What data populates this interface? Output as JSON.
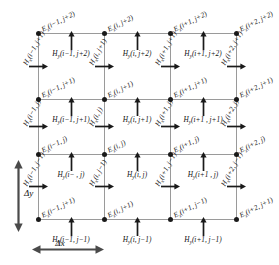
{
  "figure": {
    "type": "fdtd-yee-grid-diagram",
    "node_color": "#1a1a1a",
    "grid_line_color": "#9a9a9a",
    "text_color": "#111111"
  },
  "axes": {
    "dy_label": "Δy",
    "dx_label": "Δx",
    "dy_name": "delta-y-dimension",
    "dx_name": "delta-x-dimension"
  },
  "symbols": {
    "E": "E",
    "E_sub": "z",
    "Hx": "H",
    "Hx_sub": "x",
    "Hy": "H",
    "Hy_sub": "y"
  },
  "grid": {
    "columns": 4,
    "rows": 4,
    "col_x": [
      38,
      104,
      170,
      236
    ],
    "row_y": [
      33,
      99,
      154,
      219
    ]
  },
  "ez_nodes": [
    {
      "col": 0,
      "row": 0,
      "arg": "(i−1, j+2)"
    },
    {
      "col": 1,
      "row": 0,
      "arg": "(i, j+2)"
    },
    {
      "col": 2,
      "row": 0,
      "arg": "(i+1, j+2)"
    },
    {
      "col": 3,
      "row": 0,
      "arg": "(i+2, j+2)"
    },
    {
      "col": 0,
      "row": 1,
      "arg": "(i−1, j+1)"
    },
    {
      "col": 1,
      "row": 1,
      "arg": "(i, j+1)"
    },
    {
      "col": 2,
      "row": 1,
      "arg": "(i+1, j+1)"
    },
    {
      "col": 3,
      "row": 1,
      "arg": "(i+2, j+1)"
    },
    {
      "col": 0,
      "row": 2,
      "arg": "(i−1, j)"
    },
    {
      "col": 1,
      "row": 2,
      "arg": "(i, j)"
    },
    {
      "col": 2,
      "row": 2,
      "arg": "(i+1, j)"
    },
    {
      "col": 3,
      "row": 2,
      "arg": "(i+2, j)"
    },
    {
      "col": 0,
      "row": 3,
      "arg": "(i−1, j+1)"
    },
    {
      "col": 1,
      "row": 3,
      "arg": "(i, j+1)"
    },
    {
      "col": 2,
      "row": 3,
      "arg": "(i+1, j−1)"
    },
    {
      "col": 3,
      "row": 3,
      "arg": "(i+2, j+1)"
    }
  ],
  "hy_arrows": [
    {
      "cell_col": 0,
      "row": 0,
      "arg": "(i−1, j+2)"
    },
    {
      "cell_col": 1,
      "row": 0,
      "arg": "(i, j+2)"
    },
    {
      "cell_col": 2,
      "row": 0,
      "arg": "(i+1, j+2)"
    },
    {
      "cell_col": 0,
      "row": 1,
      "arg": "(i−1, j+1)"
    },
    {
      "cell_col": 1,
      "row": 1,
      "arg": "(i, j+1)"
    },
    {
      "cell_col": 2,
      "row": 1,
      "arg": "(i+1 , j+1)"
    },
    {
      "cell_col": 0,
      "row": 2,
      "arg": "(i− , j)"
    },
    {
      "cell_col": 1,
      "row": 2,
      "arg": "(i, j)"
    },
    {
      "cell_col": 2,
      "row": 2,
      "arg": "(i+1 , j)"
    },
    {
      "cell_col": 0,
      "row": 3,
      "arg": "(i−1, j−1)"
    },
    {
      "cell_col": 1,
      "row": 3,
      "arg": "(i, j−1)"
    },
    {
      "cell_col": 2,
      "row": 3,
      "arg": "(i+1, j−1)"
    }
  ],
  "hx_arrows": [
    {
      "col": 0,
      "cell_row": 0,
      "arg": "(i−1, j+1)"
    },
    {
      "col": 1,
      "cell_row": 0,
      "arg": "(i, j+1)"
    },
    {
      "col": 2,
      "cell_row": 0,
      "arg": "(i+1, j+1)"
    },
    {
      "col": 3,
      "cell_row": 0,
      "arg": "(i+2, j+1)"
    },
    {
      "col": 0,
      "cell_row": 1,
      "arg": "(i−1, j)"
    },
    {
      "col": 1,
      "cell_row": 1,
      "arg": "(i, j)"
    },
    {
      "col": 2,
      "cell_row": 1,
      "arg": "(i+1, j)"
    },
    {
      "col": 3,
      "cell_row": 1,
      "arg": "(i+2, j)"
    },
    {
      "col": 0,
      "cell_row": 2,
      "arg": "(i−1, j−1)"
    },
    {
      "col": 1,
      "cell_row": 2,
      "arg": "(i, j−1)"
    },
    {
      "col": 2,
      "cell_row": 2,
      "arg": "(i+1, j−1)"
    },
    {
      "col": 3,
      "cell_row": 2,
      "arg": "(i+2, j−1)"
    }
  ]
}
